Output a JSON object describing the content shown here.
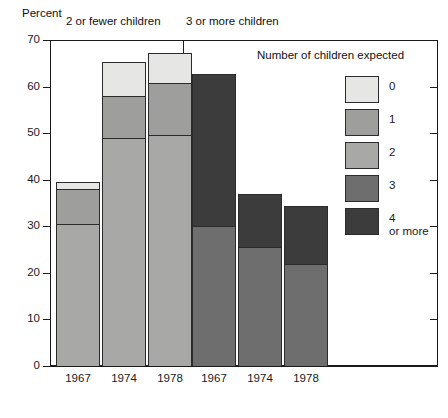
{
  "axis": {
    "y_title": "Percent",
    "y_ticks": [
      0,
      10,
      20,
      30,
      40,
      50,
      60,
      70
    ],
    "ylim": [
      0,
      70
    ]
  },
  "groups": [
    {
      "label": "2 or fewer children"
    },
    {
      "label": "3 or more children"
    }
  ],
  "legend": {
    "title": "Number of children expected",
    "items": [
      {
        "label": "0",
        "label2": "",
        "color": "#e6e6e4"
      },
      {
        "label": "1",
        "label2": "",
        "color": "#9e9e9c"
      },
      {
        "label": "2",
        "label2": "",
        "color": "#a8a8a6"
      },
      {
        "label": "3",
        "label2": "",
        "color": "#6e6e6e"
      },
      {
        "label": "4",
        "label2": "or more",
        "color": "#3c3c3c"
      }
    ]
  },
  "x_labels": [
    "1967",
    "1974",
    "1978",
    "1967",
    "1974",
    "1978"
  ],
  "chart_data": {
    "type": "bar",
    "subtype": "stacked",
    "title": "",
    "xlabel": "",
    "ylabel": "Percent",
    "ylim": [
      0,
      70
    ],
    "yticks": [
      0,
      10,
      20,
      30,
      40,
      50,
      60,
      70
    ],
    "grid": false,
    "legend_position": "right",
    "legend_title": "Number of children expected",
    "series_names": [
      "0",
      "1",
      "2",
      "3",
      "4 or more"
    ],
    "panels": [
      {
        "name": "2 or fewer children",
        "categories": [
          "1967",
          "1974",
          "1978"
        ],
        "series": [
          {
            "name": "2",
            "values": [
              30.5,
              49.0,
              49.5
            ]
          },
          {
            "name": "1",
            "values": [
              7.5,
              9.0,
              11.3
            ]
          },
          {
            "name": "0",
            "values": [
              1.5,
              7.3,
              6.5
            ]
          }
        ],
        "totals": [
          39.5,
          65.3,
          67.3
        ]
      },
      {
        "name": "3 or more children",
        "categories": [
          "1967",
          "1974",
          "1978"
        ],
        "series": [
          {
            "name": "3",
            "values": [
              30.0,
              25.5,
              22.0
            ]
          },
          {
            "name": "4 or more",
            "values": [
              32.8,
              11.5,
              12.3
            ]
          }
        ],
        "totals": [
          62.8,
          37.0,
          34.3
        ]
      }
    ]
  }
}
